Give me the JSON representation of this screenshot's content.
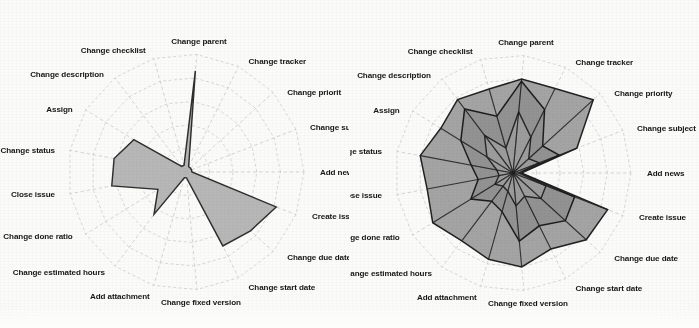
{
  "figure": {
    "kind": "two-radar-charts",
    "background_color": "#fbfbfa",
    "panels": [
      {
        "id": "left",
        "position": "left",
        "fill_color": "#b1b1b1",
        "line_color": "#2e2e2e"
      },
      {
        "id": "right",
        "position": "right",
        "fill_color": "#8f8f8f",
        "line_color": "#222222"
      }
    ]
  },
  "axes_labels": {
    "add_news": "Add news",
    "change_subject": "Change subject",
    "change_priority": "Change priority",
    "change_tracker": "Change tracker",
    "change_parent": "Change parent",
    "change_checklist": "Change checklist",
    "change_description": "Change description",
    "assign": "Assign",
    "change_status": "Change status",
    "close_issue": "Close issue",
    "change_done_ratio": "Change done ratio",
    "change_estimated_hours": "Change estimated hours",
    "add_attachment": "Add attachment",
    "change_fixed_version": "Change fixed version",
    "change_start_date": "Change start date",
    "change_due_date": "Change due date",
    "create_issue": "Create issue"
  },
  "axes_labels_left": {
    "add_news": "Add new",
    "change_priority": "Change priorit"
  },
  "chart_data": [
    {
      "id": "left-radar",
      "type": "radar",
      "title": "",
      "grid": true,
      "rings": 5,
      "rmax": 1.0,
      "legend": "none",
      "categories": [
        "Add news",
        "Change subject",
        "Change priority",
        "Change tracker",
        "Change parent",
        "Change checklist",
        "Change description",
        "Assign",
        "Change status",
        "Close issue",
        "Change done ratio",
        "Change estimated hours",
        "Add attachment",
        "Change fixed version",
        "Change start date",
        "Change due date",
        "Create issue"
      ],
      "series": [
        {
          "name": "series-1",
          "values": [
            0.05,
            0.05,
            0.05,
            0.05,
            0.86,
            0.06,
            0.06,
            0.52,
            0.62,
            0.64,
            0.28,
            0.45,
            0.05,
            0.05,
            0.7,
            0.74,
            0.82
          ]
        }
      ]
    },
    {
      "id": "right-radar",
      "type": "radar",
      "title": "",
      "grid": true,
      "rings": 5,
      "rmax": 1.0,
      "legend": "none",
      "categories": [
        "Add news",
        "Change subject",
        "Change priority",
        "Change tracker",
        "Change parent",
        "Change checklist",
        "Change description",
        "Assign",
        "Change status",
        "Close issue",
        "Change done ratio",
        "Change estimated hours",
        "Add attachment",
        "Change fixed version",
        "Change start date",
        "Change due date",
        "Create issue"
      ],
      "series": [
        {
          "name": "series-1",
          "values": [
            0.07,
            0.58,
            0.92,
            0.8,
            0.8,
            0.74,
            0.78,
            0.72,
            0.8,
            0.74,
            0.8,
            0.72,
            0.76,
            0.8,
            0.72,
            0.84,
            0.86
          ]
        },
        {
          "name": "series-2",
          "values": [
            0.06,
            0.42,
            0.34,
            0.6,
            0.78,
            0.5,
            0.68,
            0.52,
            0.36,
            0.3,
            0.42,
            0.3,
            0.34,
            0.58,
            0.5,
            0.6,
            0.56
          ]
        },
        {
          "name": "series-3",
          "values": [
            0.05,
            0.24,
            0.18,
            0.34,
            0.52,
            0.22,
            0.4,
            0.26,
            0.14,
            0.12,
            0.18,
            0.14,
            0.16,
            0.28,
            0.22,
            0.32,
            0.3
          ]
        }
      ]
    }
  ]
}
